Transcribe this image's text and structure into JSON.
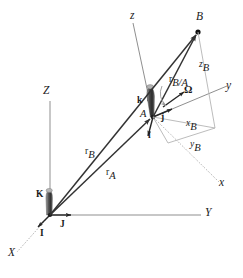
{
  "figure": {
    "kind": "kinematics-vector-diagram",
    "background_color": "#ffffff",
    "stroke_color": "#333333",
    "light_stroke_color": "#a8a8a8",
    "label_color": "#1a1a1a"
  },
  "labels": {
    "axis_X": "X",
    "axis_Y": "Y",
    "axis_Z": "Z",
    "axis_x": "x",
    "axis_y": "y",
    "axis_z": "z",
    "point_A": "A",
    "point_B": "B",
    "unit_I": "I",
    "unit_J": "J",
    "unit_K": "K",
    "unit_i": "i",
    "unit_j": "j",
    "unit_k": "k",
    "omega": "Ω",
    "vec_rA": "r",
    "vec_rA_sub": "A",
    "vec_rB": "r",
    "vec_rB_sub": "B",
    "vec_rBA": "r",
    "vec_rBA_sub": "B/A",
    "coord_xB": "x",
    "coord_xB_sub": "B",
    "coord_yB": "y",
    "coord_yB_sub": "B",
    "coord_zB": "z",
    "coord_zB_sub": "B"
  },
  "geometry": {
    "origin_O": [
      50,
      215
    ],
    "point_A": [
      153,
      117
    ],
    "point_B": [
      198,
      32
    ],
    "corner_xy": [
      215,
      128
    ],
    "corner_y": [
      168,
      143
    ]
  }
}
